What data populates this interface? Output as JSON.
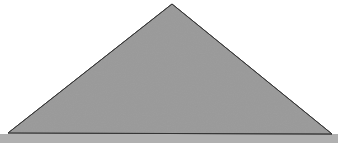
{
  "figure": {
    "canvas": {
      "width": 338,
      "height": 143,
      "background_color": "#ffffff"
    },
    "shape": {
      "name": "triangle",
      "kind": "isosceles-triangle",
      "fill_color": "#9a9a9a",
      "stroke_color": "#333333",
      "stroke_width": 1,
      "vertices": [
        {
          "label": "apex",
          "x": 172,
          "y": 4
        },
        {
          "label": "bottom-right",
          "x": 332,
          "y": 134
        },
        {
          "label": "bottom-left",
          "x": 8,
          "y": 133
        }
      ],
      "points_attr": "172,4 332,134 8,133"
    },
    "baseline_band": {
      "name": "baseline-shadow-band",
      "color": "#b0b0b0",
      "x": 0,
      "y": 134,
      "width": 338,
      "height": 9
    },
    "texture": {
      "name": "paper-noise",
      "description": "subtle scan grain over the gray fill",
      "opacity": 0.1
    },
    "clipped_text": {
      "name": "cropped-caption-remnant",
      "legible": false,
      "fragment_a": "agon",
      "fragment_b": "p"
    }
  }
}
